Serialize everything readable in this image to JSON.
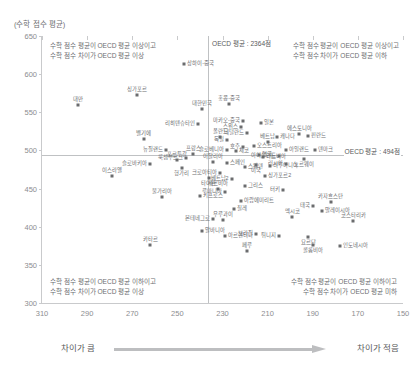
{
  "chart_data": {
    "type": "scatter",
    "title": "",
    "ylabel": "(수학 점수 평균)",
    "xlabel": "",
    "xlim": [
      310,
      150
    ],
    "ylim": [
      300,
      650
    ],
    "x_axis_reversed": true,
    "grid": false,
    "legend": "none",
    "xticks": [
      "310",
      "290",
      "270",
      "250",
      "230",
      "210",
      "190",
      "170",
      "150"
    ],
    "yticks": [
      "650",
      "600",
      "550",
      "500",
      "450",
      "400",
      "350",
      "300"
    ],
    "reference_lines": {
      "vertical": {
        "value": 236.4,
        "label": "OECD 평균 : 2364점"
      },
      "horizontal": {
        "value": 494,
        "label": "OECD 평균 : 494점"
      }
    },
    "quadrant_notes": {
      "top_left": "수학 점수 평균이 OECD 평균 이상이고\n수학 점수 차이가 OECD 평균 이상",
      "top_right": "수학 점수 평균이 OECD 평균 이상이고\n수학 점수 차이가 OECD 평균 이하",
      "bottom_left": "수학 점수 평균이 OECD 평균 이하이고\n수학 점수 차이가 OECD 평균 이상",
      "bottom_right": "수학 점수 평균이 OECD 평균 이하이고\n수학 점수 차이가 OECD 평균 미하"
    },
    "axis_band": {
      "left_label": "차이가 큼",
      "right_label": "차이가 적음"
    },
    "points": [
      {
        "name": "상하이-중국",
        "x": 247,
        "y": 613,
        "pos": "r"
      },
      {
        "name": "싱가포르",
        "x": 268,
        "y": 573,
        "pos": "t"
      },
      {
        "name": "대만",
        "x": 294,
        "y": 560,
        "pos": "t"
      },
      {
        "name": "홍콩-중국",
        "x": 227,
        "y": 561,
        "pos": "t"
      },
      {
        "name": "대한민국",
        "x": 239,
        "y": 554,
        "pos": "t"
      },
      {
        "name": "마카오-중국",
        "x": 221,
        "y": 538,
        "pos": "l"
      },
      {
        "name": "리히텐슈타인",
        "x": 241,
        "y": 535,
        "pos": "l"
      },
      {
        "name": "일본",
        "x": 213,
        "y": 536,
        "pos": "r"
      },
      {
        "name": "스위스",
        "x": 222,
        "y": 531,
        "pos": "l"
      },
      {
        "name": "에스토니아",
        "x": 196,
        "y": 521,
        "pos": "t"
      },
      {
        "name": "벨기에",
        "x": 265,
        "y": 515,
        "pos": "t"
      },
      {
        "name": "네덜란드",
        "x": 219,
        "y": 523,
        "pos": "l"
      },
      {
        "name": "베트남",
        "x": 210,
        "y": 511,
        "pos": "t"
      },
      {
        "name": "독일",
        "x": 228,
        "y": 514,
        "pos": "l"
      },
      {
        "name": "폴란드",
        "x": 231,
        "y": 518,
        "pos": "t"
      },
      {
        "name": "캐나다",
        "x": 206,
        "y": 518,
        "pos": "r"
      },
      {
        "name": "핀란드",
        "x": 192,
        "y": 519,
        "pos": "r"
      },
      {
        "name": "오스트리아",
        "x": 216,
        "y": 506,
        "pos": "r"
      },
      {
        "name": "호주",
        "x": 221,
        "y": 504,
        "pos": "l"
      },
      {
        "name": "아일랜드",
        "x": 202,
        "y": 501,
        "pos": "r"
      },
      {
        "name": "슬로베니아",
        "x": 228,
        "y": 501,
        "pos": "l"
      },
      {
        "name": "덴마크",
        "x": 189,
        "y": 500,
        "pos": "r"
      },
      {
        "name": "뉴질랜드",
        "x": 255,
        "y": 500,
        "pos": "l"
      },
      {
        "name": "프랑스",
        "x": 243,
        "y": 495,
        "pos": "t"
      },
      {
        "name": "체코",
        "x": 224,
        "y": 499,
        "pos": "r"
      },
      {
        "name": "영국",
        "x": 214,
        "y": 494,
        "pos": "r"
      },
      {
        "name": "아이슬란드",
        "x": 205,
        "y": 493,
        "pos": "l"
      },
      {
        "name": "노르웨이",
        "x": 194,
        "y": 489,
        "pos": "b"
      },
      {
        "name": "룩셈부르크",
        "x": 246,
        "y": 490,
        "pos": "l"
      },
      {
        "name": "라트비아",
        "x": 212,
        "y": 491,
        "pos": "r"
      },
      {
        "name": "포르투갈",
        "x": 250,
        "y": 487,
        "pos": "t"
      },
      {
        "name": "이탈리아",
        "x": 234,
        "y": 485,
        "pos": "t"
      },
      {
        "name": "스페인",
        "x": 228,
        "y": 484,
        "pos": "r"
      },
      {
        "name": "러시아",
        "x": 202,
        "y": 482,
        "pos": "l"
      },
      {
        "name": "슬로바키아",
        "x": 262,
        "y": 482,
        "pos": "l"
      },
      {
        "name": "미국",
        "x": 215,
        "y": 481,
        "pos": "b"
      },
      {
        "name": "리투아니아",
        "x": 209,
        "y": 479,
        "pos": "r"
      },
      {
        "name": "스웨덴",
        "x": 220,
        "y": 478,
        "pos": "r"
      },
      {
        "name": "헝가리",
        "x": 248,
        "y": 477,
        "pos": "b"
      },
      {
        "name": "이스라엘",
        "x": 279,
        "y": 466,
        "pos": "t"
      },
      {
        "name": "크로아티아",
        "x": 231,
        "y": 471,
        "pos": "l"
      },
      {
        "name": "그리스",
        "x": 220,
        "y": 453,
        "pos": "r"
      },
      {
        "name": "세르비아",
        "x": 232,
        "y": 449,
        "pos": "t"
      },
      {
        "name": "루마니아",
        "x": 229,
        "y": 445,
        "pos": "l"
      },
      {
        "name": "불가리아",
        "x": 257,
        "y": 439,
        "pos": "t"
      },
      {
        "name": "아랍에미리트",
        "x": 222,
        "y": 434,
        "pos": "r"
      },
      {
        "name": "카자흐스탄",
        "x": 182,
        "y": 432,
        "pos": "t"
      },
      {
        "name": "태국",
        "x": 190,
        "y": 427,
        "pos": "l"
      },
      {
        "name": "칠레",
        "x": 225,
        "y": 423,
        "pos": "r"
      },
      {
        "name": "말레이시아",
        "x": 186,
        "y": 421,
        "pos": "r"
      },
      {
        "name": "멕시코",
        "x": 199,
        "y": 413,
        "pos": "t"
      },
      {
        "name": "우루과이",
        "x": 230,
        "y": 409,
        "pos": "t"
      },
      {
        "name": "코스타리카",
        "x": 172,
        "y": 407,
        "pos": "t"
      },
      {
        "name": "알바니아",
        "x": 239,
        "y": 394,
        "pos": "r"
      },
      {
        "name": "요르단",
        "x": 192,
        "y": 386,
        "pos": "b"
      },
      {
        "name": "카타르",
        "x": 262,
        "y": 376,
        "pos": "t"
      },
      {
        "name": "콜롬비아",
        "x": 190,
        "y": 376,
        "pos": "b"
      },
      {
        "name": "인도네시아",
        "x": 178,
        "y": 375,
        "pos": "r"
      },
      {
        "name": "페루",
        "x": 219,
        "y": 368,
        "pos": "t"
      },
      {
        "name": "아르헨티나",
        "x": 229,
        "y": 388,
        "pos": "r"
      },
      {
        "name": "브라질",
        "x": 215,
        "y": 391,
        "pos": "l"
      },
      {
        "name": "튀니지",
        "x": 205,
        "y": 388,
        "pos": "l"
      },
      {
        "name": "몬테네그로",
        "x": 234,
        "y": 410,
        "pos": "l"
      },
      {
        "name": "터키",
        "x": 203,
        "y": 448,
        "pos": "l"
      },
      {
        "name": "키프로스",
        "x": 240,
        "y": 440,
        "pos": "r"
      },
      {
        "name": "타이완",
        "x": 236,
        "y": 464,
        "pos": "b"
      },
      {
        "name": "싱가포르2",
        "x": 211,
        "y": 466,
        "pos": "r"
      },
      {
        "name": "베트남2",
        "x": 226,
        "y": 462,
        "pos": "l"
      }
    ]
  }
}
